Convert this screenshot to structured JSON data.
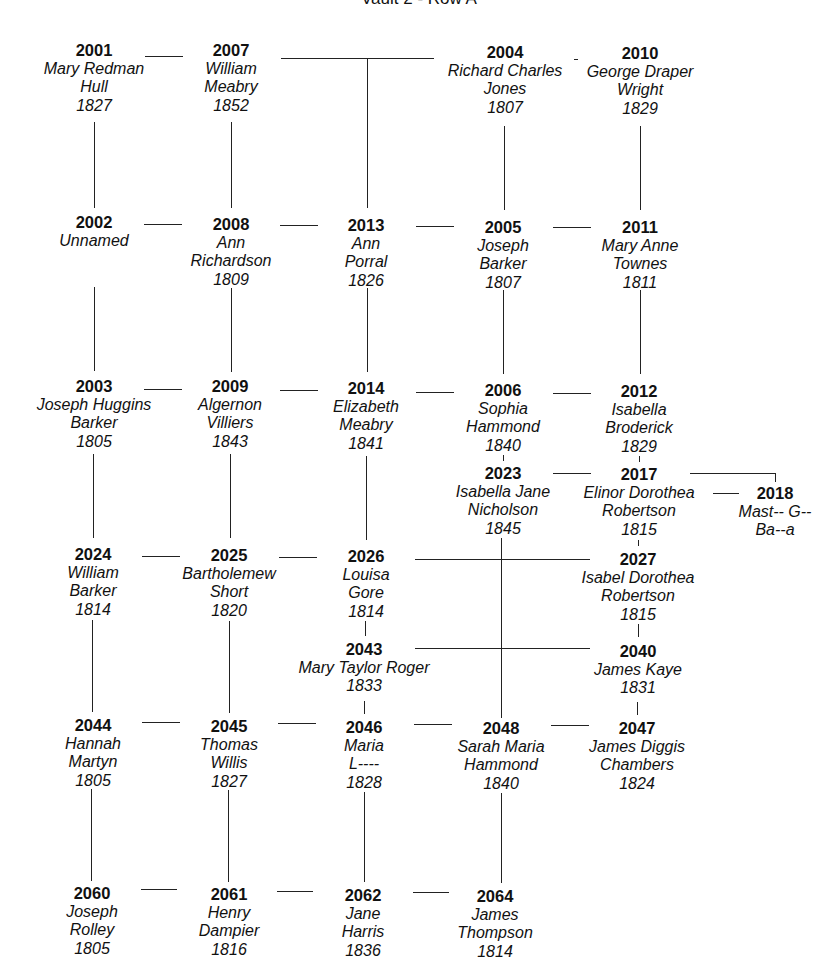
{
  "title": "Vault 2 - Row A",
  "nodes": [
    {
      "id": "2001",
      "lines": [
        "Mary Redman",
        "Hull",
        "1827"
      ],
      "x": 94,
      "y": 41
    },
    {
      "id": "2007",
      "lines": [
        "William",
        "Meabry",
        "1852"
      ],
      "x": 231,
      "y": 41
    },
    {
      "id": "2004",
      "lines": [
        "Richard Charles",
        "Jones",
        "1807"
      ],
      "x": 505,
      "y": 43
    },
    {
      "id": "2010",
      "lines": [
        "George Draper",
        "Wright",
        "1829"
      ],
      "x": 640,
      "y": 44
    },
    {
      "id": "2002",
      "lines": [
        "Unnamed"
      ],
      "x": 94,
      "y": 213
    },
    {
      "id": "2008",
      "lines": [
        "Ann",
        "Richardson",
        "1809"
      ],
      "x": 231,
      "y": 215
    },
    {
      "id": "2013",
      "lines": [
        "Ann",
        "Porral",
        "1826"
      ],
      "x": 366,
      "y": 216
    },
    {
      "id": "2005",
      "lines": [
        "Joseph",
        "Barker",
        "1807"
      ],
      "x": 503,
      "y": 218
    },
    {
      "id": "2011",
      "lines": [
        "Mary Anne",
        "Townes",
        "1811"
      ],
      "x": 640,
      "y": 218
    },
    {
      "id": "2003",
      "lines": [
        "Joseph Huggins",
        "Barker",
        "1805"
      ],
      "x": 94,
      "y": 377
    },
    {
      "id": "2009",
      "lines": [
        "Algernon",
        "Villiers",
        "1843"
      ],
      "x": 230,
      "y": 377
    },
    {
      "id": "2014",
      "lines": [
        "Elizabeth",
        "Meabry",
        "1841"
      ],
      "x": 366,
      "y": 379
    },
    {
      "id": "2006",
      "lines": [
        "Sophia",
        "Hammond",
        "1840"
      ],
      "x": 503,
      "y": 381
    },
    {
      "id": "2012",
      "lines": [
        "Isabella",
        "Broderick",
        "1829"
      ],
      "x": 639,
      "y": 382
    },
    {
      "id": "2023",
      "lines": [
        "Isabella Jane",
        "Nicholson",
        "1845"
      ],
      "x": 503,
      "y": 464
    },
    {
      "id": "2017",
      "lines": [
        "Elinor Dorothea",
        "Robertson",
        "1815"
      ],
      "x": 639,
      "y": 465
    },
    {
      "id": "2018",
      "lines": [
        "Mast-- G--",
        "Ba--a"
      ],
      "x": 775,
      "y": 484
    },
    {
      "id": "2024",
      "lines": [
        "William",
        "Barker",
        "1814"
      ],
      "x": 93,
      "y": 545
    },
    {
      "id": "2025",
      "lines": [
        "Bartholemew",
        "Short",
        "1820"
      ],
      "x": 229,
      "y": 546
    },
    {
      "id": "2026",
      "lines": [
        "Louisa",
        "Gore",
        "1814"
      ],
      "x": 366,
      "y": 547
    },
    {
      "id": "2027",
      "lines": [
        "Isabel Dorothea",
        "Robertson",
        "1815"
      ],
      "x": 638,
      "y": 550
    },
    {
      "id": "2043",
      "lines": [
        "Mary Taylor Roger",
        "1833"
      ],
      "x": 364,
      "y": 640
    },
    {
      "id": "2040",
      "lines": [
        "James Kaye",
        "1831"
      ],
      "x": 638,
      "y": 642
    },
    {
      "id": "2044",
      "lines": [
        "Hannah",
        "Martyn",
        "1805"
      ],
      "x": 93,
      "y": 716
    },
    {
      "id": "2045",
      "lines": [
        "Thomas",
        "Willis",
        "1827"
      ],
      "x": 229,
      "y": 717
    },
    {
      "id": "2046",
      "lines": [
        "Maria",
        "L----",
        "1828"
      ],
      "x": 364,
      "y": 718
    },
    {
      "id": "2048",
      "lines": [
        "Sarah Maria",
        "Hammond",
        "1840"
      ],
      "x": 501,
      "y": 719
    },
    {
      "id": "2047",
      "lines": [
        "James Diggis",
        "Chambers",
        "1824"
      ],
      "x": 637,
      "y": 719
    },
    {
      "id": "2060",
      "lines": [
        "Joseph",
        "Rolley",
        "1805"
      ],
      "x": 92,
      "y": 884
    },
    {
      "id": "2061",
      "lines": [
        "Henry",
        "Dampier",
        "1816"
      ],
      "x": 229,
      "y": 885
    },
    {
      "id": "2062",
      "lines": [
        "Jane",
        "Harris",
        "1836"
      ],
      "x": 363,
      "y": 886
    },
    {
      "id": "2064",
      "lines": [
        "James",
        "Thompson",
        "1814"
      ],
      "x": 495,
      "y": 887
    }
  ]
}
